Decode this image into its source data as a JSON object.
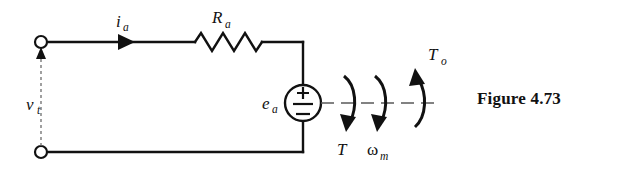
{
  "figure": {
    "caption": "Figure 4.73",
    "background_color": "#ffffff",
    "ink_color": "#111111"
  },
  "circuit": {
    "title": "DC motor armature equivalent circuit with mechanical shaft",
    "labels": {
      "terminal_voltage": "v",
      "terminal_voltage_sub": "t",
      "armature_current": "i",
      "armature_current_sub": "a",
      "armature_resistance": "R",
      "armature_resistance_sub": "a",
      "back_emf": "e",
      "back_emf_sub": "a",
      "plus_sign": "+",
      "minus_sign": "−",
      "torque": "T",
      "angular_speed": "ω",
      "angular_speed_sub": "m",
      "output_torque": "T",
      "output_torque_sub": "o"
    },
    "elements": [
      {
        "name": "top-terminal-node",
        "type": "open-terminal"
      },
      {
        "name": "bottom-terminal-node",
        "type": "open-terminal"
      },
      {
        "name": "armature-resistor",
        "type": "resistor-zigzag"
      },
      {
        "name": "back-emf-source",
        "type": "voltage-source-circle"
      },
      {
        "name": "current-arrow",
        "type": "arrowhead-right"
      },
      {
        "name": "terminal-voltage-arrow",
        "type": "arrowhead-up"
      },
      {
        "name": "shaft",
        "type": "dashed-line"
      },
      {
        "name": "torque-arrow-T",
        "type": "curved-arrow-down"
      },
      {
        "name": "speed-arrow-omega",
        "type": "curved-arrow-down"
      },
      {
        "name": "output-torque-arrow-To",
        "type": "curved-arrow-up"
      }
    ]
  }
}
